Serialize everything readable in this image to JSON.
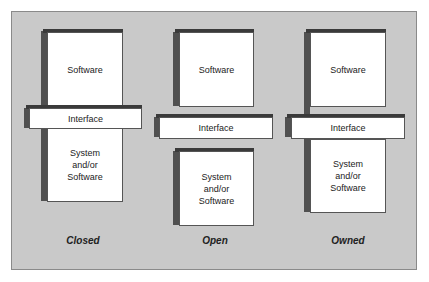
{
  "diagram": {
    "columns": [
      {
        "name": "Closed",
        "top_box": "Software",
        "interface": "Interface",
        "bottom_box": "System and/or Software"
      },
      {
        "name": "Open",
        "top_box": "Software",
        "interface": "Interface",
        "bottom_box": "System and/or Software"
      },
      {
        "name": "Owned",
        "top_box": "Software",
        "interface": "Interface",
        "bottom_box": "System and/or Software"
      }
    ],
    "colors": {
      "background": "#c9c9c9",
      "box": "#ffffff",
      "shadow": "#505050"
    }
  }
}
